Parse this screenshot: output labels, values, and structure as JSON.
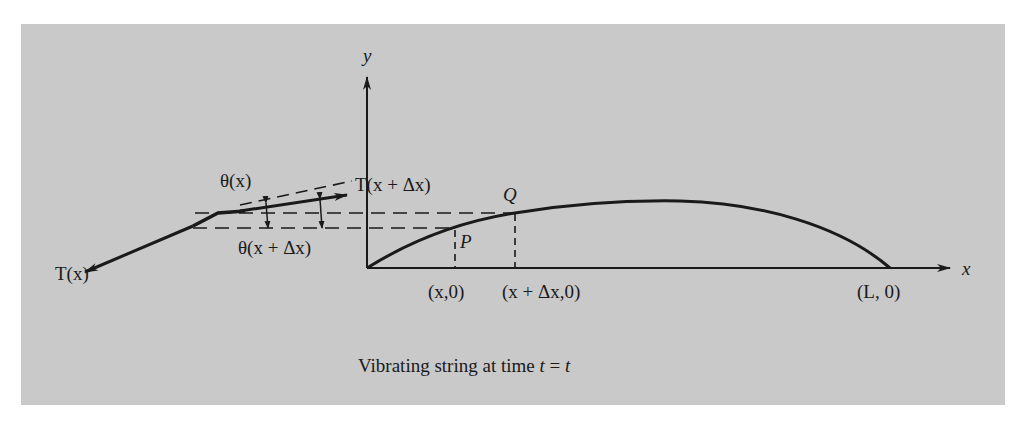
{
  "figure": {
    "background": "#c9c9c9",
    "ink": "#1a1a1a",
    "caption": {
      "text": "Vibrating string at time ",
      "var1": "t",
      "eq": " = ",
      "var2": "t"
    },
    "axes": {
      "x_label": "x",
      "y_label": "y"
    },
    "labels": {
      "tension_left": "T(x)",
      "tension_right": "T(x + Δx)",
      "theta_x": "θ(x)",
      "theta_x_dx": "θ(x + Δx)",
      "point_p": "P",
      "point_q": "Q",
      "tick_x": "(x,0)",
      "tick_x_dx": "(x + Δx,0)",
      "tick_L": "(L, 0)"
    }
  }
}
